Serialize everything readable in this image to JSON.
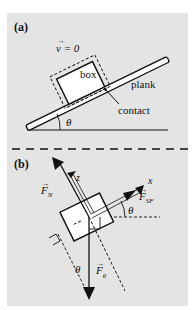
{
  "panel_a": {
    "label": "(a)",
    "velocity_label": "v = 0",
    "velocity_arrow": "→",
    "box_label": "box",
    "plank_label": "plank",
    "contact_label": "contact",
    "angle_label": "θ"
  },
  "panel_b": {
    "label": "(b)",
    "normal_force_label": "F",
    "normal_force_sub": "N",
    "static_friction_label": "F",
    "static_friction_sub": "SF",
    "gravity_label": "F",
    "gravity_sub": "g",
    "x_axis_label": "x",
    "z_axis_label": "z",
    "angle_label_upper": "θ",
    "angle_label_lower": "θ",
    "vector_arrow": "→"
  },
  "colors": {
    "panel_bg": "#e4e4e4",
    "ink": "#111111",
    "box_fill": "#ffffff"
  }
}
